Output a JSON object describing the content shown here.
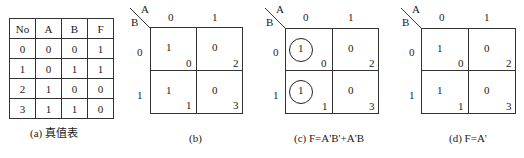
{
  "truth_table": {
    "headers": [
      "No",
      "A",
      "B",
      "F"
    ],
    "rows": [
      [
        "0",
        "0",
        "0",
        "1"
      ],
      [
        "1",
        "0",
        "1",
        "1"
      ],
      [
        "2",
        "1",
        "0",
        "0"
      ],
      [
        "3",
        "1",
        "1",
        "0"
      ]
    ],
    "caption": "(a) 真值表"
  },
  "kmaps": [
    {
      "var_col": "A",
      "var_row": "B",
      "col_labels": [
        "0",
        "1"
      ],
      "row_labels": [
        "0",
        "1"
      ],
      "cells": [
        {
          "value": "1",
          "index": "0",
          "circled": false
        },
        {
          "value": "0",
          "index": "2",
          "circled": false
        },
        {
          "value": "1",
          "index": "1",
          "circled": false
        },
        {
          "value": "0",
          "index": "3",
          "circled": false
        }
      ],
      "caption": "(b)"
    },
    {
      "var_col": "A",
      "var_row": "B",
      "col_labels": [
        "0",
        "1"
      ],
      "row_labels": [
        "0",
        "1"
      ],
      "cells": [
        {
          "value": "1",
          "index": "0",
          "circled": true
        },
        {
          "value": "0",
          "index": "2",
          "circled": false
        },
        {
          "value": "1",
          "index": "1",
          "circled": true
        },
        {
          "value": "0",
          "index": "3",
          "circled": false
        }
      ],
      "caption": "(c) F=A'B'+A'B"
    },
    {
      "var_col": "A",
      "var_row": "B",
      "col_labels": [
        "0",
        "1"
      ],
      "row_labels": [
        "0",
        "1"
      ],
      "cells": [
        {
          "value": "1",
          "index": "0",
          "circled": false
        },
        {
          "value": "0",
          "index": "2",
          "circled": false
        },
        {
          "value": "1",
          "index": "1",
          "circled": false
        },
        {
          "value": "0",
          "index": "3",
          "circled": false
        }
      ],
      "caption": "(d) F=A'"
    }
  ]
}
